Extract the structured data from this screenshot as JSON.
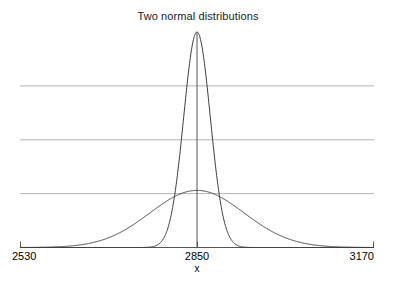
{
  "chart_data": {
    "type": "line",
    "title": "Two normal distributions",
    "xlabel": "x",
    "ylabel": "",
    "xlim": [
      2530,
      3170
    ],
    "ylim": [
      0,
      1.0
    ],
    "grid": true,
    "grid_axis": "y",
    "gridline_values": [
      0.75,
      0.5,
      0.25
    ],
    "legend": "none",
    "xticks": [
      2530,
      2850,
      3170
    ],
    "xtick_labels": [
      "2530",
      "2850",
      "3170"
    ],
    "yticks": [],
    "ytick_labels": [],
    "center_rule_x": 2850,
    "series": [
      {
        "name": "narrow normal",
        "distribution": "normal",
        "mean": 2850,
        "sigma": 24,
        "peak_height": 1.0,
        "color": "#3c3c3c"
      },
      {
        "name": "wide normal",
        "distribution": "normal",
        "mean": 2850,
        "sigma": 85,
        "peak_height": 0.265,
        "color": "#3c3c3c"
      }
    ],
    "colors": {
      "curve": "#3c3c3c",
      "axis": "#555555",
      "grid": "#b4b4b4",
      "text": "#000000",
      "background": "#ffffff"
    }
  }
}
